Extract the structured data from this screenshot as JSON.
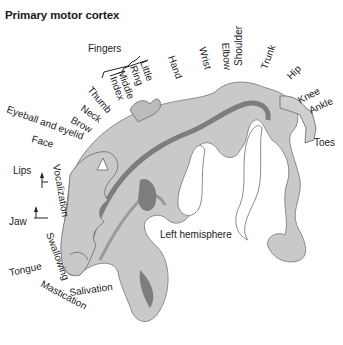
{
  "title": "Primary motor cortex",
  "colors": {
    "cortex_light": "#c9c9c9",
    "cortex_mid": "#a9a9a9",
    "cortex_dark": "#7d7d7d",
    "outline": "#8a8a8a",
    "text": "#222222"
  },
  "labels": {
    "fingers": "Fingers",
    "little": "Little",
    "ring": "Ring",
    "middle": "Middle",
    "index": "Index",
    "thumb": "Thumb",
    "neck": "Neck",
    "brow": "Brow",
    "eyeball_eyelid": "Eyeball and eyelid",
    "face": "Face",
    "lips": "Lips",
    "jaw": "Jaw",
    "vocalization": "Vocalization",
    "swallowing": "Swallowing",
    "tongue": "Tongue",
    "mastication": "Mastication",
    "salivation": "Salivation",
    "hand": "Hand",
    "wrist": "Wrist",
    "elbow": "Elbow",
    "shoulder": "Shoulder",
    "trunk": "Trunk",
    "hip": "Hip",
    "knee": "Knee",
    "ankle": "Ankle",
    "toes": "Toes",
    "hemisphere": "Left hemisphere"
  }
}
